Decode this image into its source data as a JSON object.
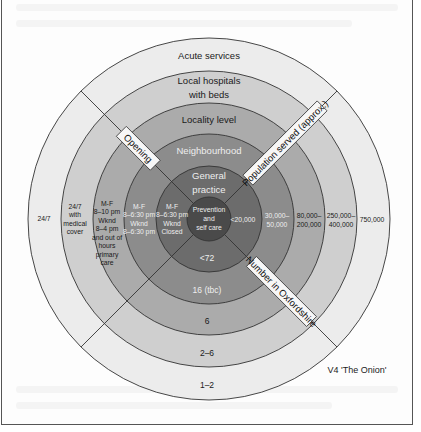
{
  "diagram": {
    "title": "V4 'The Onion'",
    "center": {
      "x": 209,
      "y": 219
    },
    "rings": [
      {
        "name": "prevention",
        "radius": 22,
        "color": "#4a4a4a",
        "service": [
          "Prevention",
          "and",
          "self care"
        ],
        "opening": [],
        "population": [],
        "number": ""
      },
      {
        "name": "general-practice",
        "radius": 53,
        "color": "#6c6c6c",
        "service": [
          "General",
          "practice"
        ],
        "opening": [
          "M-F",
          "8–6:30 pm",
          "Wknd",
          "Closed"
        ],
        "population": [
          "<20,000"
        ],
        "number": "<72"
      },
      {
        "name": "neighbourhood",
        "radius": 85,
        "color": "#8c8c8c",
        "service": [
          "Neighbourhood"
        ],
        "opening": [
          "M-F",
          "8–6:30 pm",
          "Wknd",
          "8–6:30 pm"
        ],
        "population": [
          "30,000–",
          "50,000"
        ],
        "number": "16 (tbc)"
      },
      {
        "name": "locality-level",
        "radius": 116,
        "color": "#ababab",
        "service": [
          "Locality level"
        ],
        "opening": [
          "M-F",
          "8–10 pm",
          "Wknd",
          "8–4 pm",
          "and out of",
          "hours",
          "primary",
          "care"
        ],
        "population": [
          "80,000–",
          "200,000"
        ],
        "number": "6"
      },
      {
        "name": "local-hospitals",
        "radius": 148,
        "color": "#cfcfcf",
        "service": [
          "Local hospitals",
          "with beds"
        ],
        "opening": [
          "24/7",
          "with",
          "medical",
          "cover"
        ],
        "population": [
          "250,000–",
          "400,000"
        ],
        "number": "2–6"
      },
      {
        "name": "acute-services",
        "radius": 181,
        "color": "#ececec",
        "service": [
          "Acute services"
        ],
        "opening": [
          "24/7"
        ],
        "population": [
          "750,000"
        ],
        "number": "1–2"
      }
    ],
    "axes": {
      "opening": "Opening",
      "population": "Population served (approx.)",
      "number": "Number in Oxfordshire"
    }
  }
}
